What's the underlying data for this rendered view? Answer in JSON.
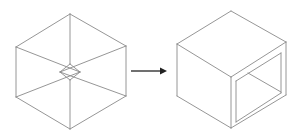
{
  "diagram": {
    "colors": {
      "edge": "#8a8a8a",
      "arrow": "#333333",
      "background": "#ffffff"
    },
    "left_cube": {
      "label": "wireframe-cube",
      "vertices": {
        "top": [
          70,
          14
        ],
        "left_top": [
          16,
          47
        ],
        "right_top": [
          126,
          46
        ],
        "left_bottom": [
          16,
          97
        ],
        "right_bottom": [
          126,
          96
        ],
        "bottom": [
          70,
          129
        ],
        "center_top": [
          70,
          64
        ],
        "center_bottom": [
          70,
          80
        ],
        "center_left": [
          60,
          72
        ],
        "center_right": [
          80,
          72
        ]
      }
    },
    "arrow": {
      "label": "transforms-to",
      "from": [
        131,
        71
      ],
      "to": [
        167,
        71
      ]
    },
    "right_cube": {
      "label": "hollow-box",
      "vertices": {
        "top": [
          231,
          11
        ],
        "left_top": [
          177,
          44
        ],
        "right_top": [
          286,
          42
        ],
        "front_top": [
          231,
          77
        ],
        "left_bottom": [
          177,
          96
        ],
        "front_bottom": [
          231,
          128
        ],
        "right_bottom": [
          286,
          95
        ]
      },
      "opening": {
        "inner_front_top": [
          236,
          81
        ],
        "inner_back_top": [
          281,
          53
        ],
        "inner_back_bottom": [
          281,
          93
        ],
        "inner_front_bottom": [
          236,
          122
        ],
        "depth_line_from": [
          248,
          73
        ],
        "depth_line_to": [
          281,
          92
        ]
      }
    }
  }
}
